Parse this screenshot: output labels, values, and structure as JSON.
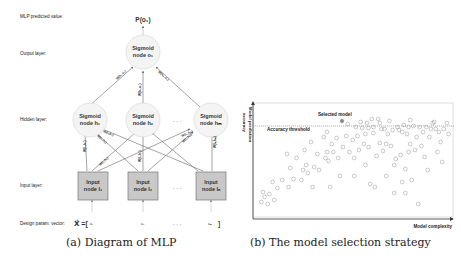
{
  "panel_a": {
    "caption": "(a) Diagram of MLP",
    "row_labels": {
      "predicted": "MLP predicted value:",
      "output": "Output layer:",
      "hidden": "Hidden layer:",
      "input": "Input layer:",
      "design": "Design param. vector:"
    },
    "predicted_value": "P(o₁)",
    "output_node": {
      "line1": "Sigmoid",
      "line2": "node o₁"
    },
    "hidden_nodes": [
      {
        "line1": "Sigmoid",
        "line2": "node h₁"
      },
      {
        "line1": "Sigmoid",
        "line2": "node h₂"
      },
      {
        "line1": "Sigmoid",
        "line2": "node hₘ"
      }
    ],
    "input_nodes": [
      {
        "line1": "Input",
        "line2": "node I₁"
      },
      {
        "line1": "Input",
        "line2": "node I₂"
      },
      {
        "line1": "Input",
        "line2": "node Iₙ"
      }
    ],
    "ellipsis": ". . .",
    "vector_prefix": "X⃗ =[",
    "vector_items": [
      "a₁",
      "a₂",
      "aₙ"
    ],
    "vector_suffix": "]",
    "weight_labels": {
      "h1_o1": "W(h₁,o₁)",
      "h2_o1": "W(h₂,o₁)",
      "hm_o1": "W(hₘ,o₁)",
      "i1_h1": "W(I₁,h₁)",
      "i2_h1": "W(I₂,h₁)",
      "in_h1": "W(Iₙ,h₁)",
      "i1_hm": "W(I₁,hₘ)",
      "i2_hm": "W(I₂,hₘ)",
      "in_hm": "W(Iₙ,hₘ)",
      "i1_h2": "W(I₁,h₂)",
      "i2_h2": "W(I₂,h₂)"
    },
    "colors": {
      "input_fill": "#c8c8c8",
      "input_stroke": "#777777",
      "circle_stroke": "#dddddd",
      "line": "#666666"
    }
  },
  "panel_b": {
    "caption": "(b) The model selection strategy",
    "y_axis_label_line1": "Model prediction",
    "y_axis_label_line2": "accuracy",
    "x_axis_label": "Model complexity",
    "threshold_label": "Accuracy threshold",
    "selected_label": "Selected model",
    "colors": {
      "point_stroke": "#8a8a8a",
      "selected_fill": "#8a8a8a",
      "axis": "#333333",
      "threshold": "#555555"
    }
  },
  "chart_data": {
    "type": "scatter",
    "title": "The model selection strategy",
    "xlabel": "Model complexity",
    "ylabel": "Model prediction accuracy",
    "axis_ticks": "none",
    "threshold_line": {
      "label": "Accuracy threshold",
      "y": 0.86
    },
    "selected_point": {
      "label": "Selected model",
      "x": 0.47,
      "y": 0.9
    },
    "points": [
      [
        0.04,
        0.12
      ],
      [
        0.05,
        0.22
      ],
      [
        0.06,
        0.17
      ],
      [
        0.08,
        0.1
      ],
      [
        0.09,
        0.2
      ],
      [
        0.11,
        0.32
      ],
      [
        0.12,
        0.14
      ],
      [
        0.14,
        0.26
      ],
      [
        0.17,
        0.34
      ],
      [
        0.2,
        0.6
      ],
      [
        0.21,
        0.27
      ],
      [
        0.22,
        0.46
      ],
      [
        0.24,
        0.35
      ],
      [
        0.26,
        0.56
      ],
      [
        0.29,
        0.34
      ],
      [
        0.3,
        0.44
      ],
      [
        0.31,
        0.64
      ],
      [
        0.32,
        0.49
      ],
      [
        0.33,
        0.41
      ],
      [
        0.35,
        0.72
      ],
      [
        0.36,
        0.27
      ],
      [
        0.37,
        0.47
      ],
      [
        0.39,
        0.6
      ],
      [
        0.4,
        0.44
      ],
      [
        0.43,
        0.77
      ],
      [
        0.44,
        0.56
      ],
      [
        0.45,
        0.82
      ],
      [
        0.45,
        0.62
      ],
      [
        0.46,
        0.53
      ],
      [
        0.47,
        0.27
      ],
      [
        0.48,
        0.7
      ],
      [
        0.49,
        0.62
      ],
      [
        0.51,
        0.76
      ],
      [
        0.52,
        0.56
      ],
      [
        0.53,
        0.38
      ],
      [
        0.55,
        0.67
      ],
      [
        0.57,
        0.78
      ],
      [
        0.58,
        0.9
      ],
      [
        0.59,
        0.62
      ],
      [
        0.61,
        0.74
      ],
      [
        0.62,
        0.56
      ],
      [
        0.62,
        0.38
      ],
      [
        0.63,
        0.87
      ],
      [
        0.64,
        0.78
      ],
      [
        0.65,
        0.64
      ],
      [
        0.66,
        0.92
      ],
      [
        0.67,
        0.86
      ],
      [
        0.68,
        0.7
      ],
      [
        0.69,
        0.8
      ],
      [
        0.69,
        0.49
      ],
      [
        0.7,
        0.91
      ],
      [
        0.71,
        0.86
      ],
      [
        0.71,
        0.67
      ],
      [
        0.72,
        0.3
      ],
      [
        0.73,
        0.95
      ],
      [
        0.74,
        0.87
      ],
      [
        0.74,
        0.81
      ],
      [
        0.75,
        0.27
      ],
      [
        0.76,
        0.58
      ],
      [
        0.77,
        0.95
      ],
      [
        0.78,
        0.91
      ],
      [
        0.78,
        0.71
      ],
      [
        0.79,
        0.85
      ],
      [
        0.8,
        0.63
      ],
      [
        0.81,
        0.85
      ],
      [
        0.82,
        0.7
      ],
      [
        0.82,
        0.38
      ],
      [
        0.83,
        0.8
      ],
      [
        0.84,
        0.93
      ],
      [
        0.85,
        0.68
      ],
      [
        0.86,
        0.84
      ],
      [
        0.87,
        0.21
      ],
      [
        0.87,
        0.49
      ],
      [
        0.88,
        0.55
      ],
      [
        0.89,
        0.87
      ],
      [
        0.9,
        0.84
      ],
      [
        0.91,
        0.59
      ],
      [
        0.92,
        0.32
      ],
      [
        0.92,
        0.82
      ],
      [
        0.93,
        0.89
      ],
      [
        0.94,
        0.21
      ],
      [
        0.94,
        0.45
      ],
      [
        0.95,
        0.8
      ],
      [
        0.96,
        0.62
      ],
      [
        0.96,
        0.87
      ],
      [
        0.97,
        0.7
      ],
      [
        0.97,
        0.94
      ],
      [
        0.98,
        0.34
      ],
      [
        0.99,
        0.88
      ],
      [
        1.0,
        0.64
      ],
      [
        1.01,
        0.77
      ],
      [
        1.02,
        0.1
      ],
      [
        1.03,
        0.87
      ],
      [
        1.04,
        0.68
      ],
      [
        1.05,
        0.82
      ],
      [
        1.06,
        0.57
      ],
      [
        1.07,
        0.87
      ],
      [
        1.08,
        0.44
      ],
      [
        1.09,
        0.77
      ],
      [
        1.1,
        0.85
      ],
      [
        1.11,
        0.91
      ],
      [
        1.12,
        0.92
      ],
      [
        1.13,
        0.85
      ],
      [
        1.14,
        0.62
      ],
      [
        1.15,
        0.82
      ],
      [
        1.16,
        0.72
      ],
      [
        1.17,
        0.52
      ],
      [
        1.18,
        0.85
      ],
      [
        1.2,
        0.91
      ],
      [
        1.21,
        0.8
      ]
    ]
  }
}
